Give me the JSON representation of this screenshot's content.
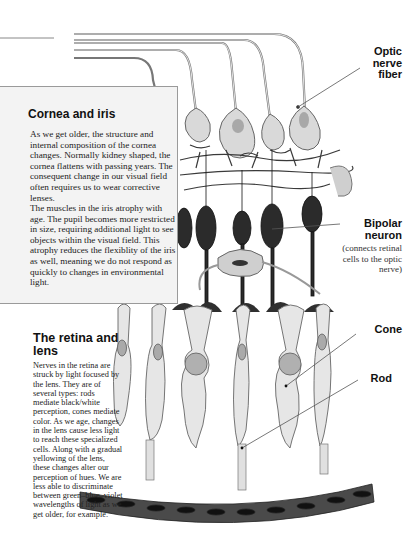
{
  "cornea_box": {
    "title": "Cornea and iris",
    "paragraph1": "As we get older, the structure and internal composition of the cornea changes.  Normally kidney shaped, the cornea flattens with passing years. The consequent change in our visual field often requires us to wear corrective lenses.",
    "paragraph2": "The muscles in the iris atrophy with age.  The pupil becomes more restricted in size, requiring additional light to see objects within the visual field.  This atrophy reduces the flexiblity of the iris as well, meaning we do not respond as quickly to changes in environmental light."
  },
  "retina_section": {
    "title": "The retina and lens",
    "body": "Nerves in the retina are struck by light focused by the lens.  They are of several types: rods mediate black/white perception, cones mediate color.  As we age, changes in the lens cause less light to reach these specialized cells.  Along with a gradual yellowing of the lens, these changes alter our perception of hues.   We are less able to discriminate between green–blue–violet wavelengths of light as we get older, for example."
  },
  "labels": {
    "optic_nerve_fiber": "Optic nerve fiber",
    "bipolar_neuron": "Bipolar neuron",
    "bipolar_neuron_note": "(connects retinal cells to the optic nerve)",
    "cone": "Cone",
    "rod": "Rod"
  },
  "colors": {
    "ganglion_fill": "#d9d9d9",
    "ganglion_nucleus": "#a8a8a8",
    "bipolar_fill": "#2b2b2b",
    "photoreceptor_fill": "#e6e6e6",
    "pigment_epithelium": "#4a4a4a",
    "box_bg": "#f3f3f3"
  }
}
